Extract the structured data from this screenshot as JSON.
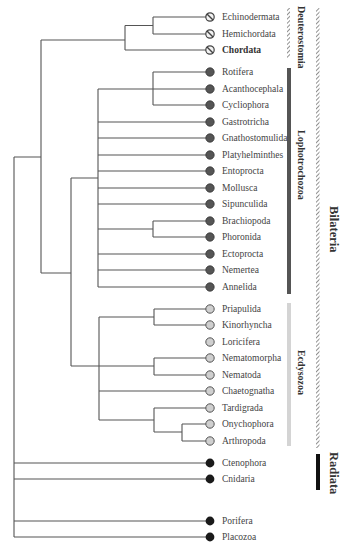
{
  "figure": {
    "styles": {
      "line_color": "#555555",
      "deuterostome_fill": "#f2f2f2",
      "lophotrochozoa_fill": "#555555",
      "ecdysozoa_fill": "#c8c8c8",
      "basal_fill": "#1a1a1a",
      "lophotrochozoa_bar": "#555555",
      "ecdysozoa_bar": "#d4d4d4",
      "radiata_bar": "#111111"
    }
  },
  "taxa": [
    {
      "name": "Echinodermata",
      "group": "deut",
      "y": 17
    },
    {
      "name": "Hemichordata",
      "group": "deut",
      "y": 34
    },
    {
      "name": "Chordata",
      "group": "deut",
      "y": 50,
      "bold": true
    },
    {
      "name": "Rotifera",
      "group": "lopho",
      "y": 72
    },
    {
      "name": "Acanthocephala",
      "group": "lopho",
      "y": 89
    },
    {
      "name": "Cycliophora",
      "group": "lopho",
      "y": 105
    },
    {
      "name": "Gastrotricha",
      "group": "lopho",
      "y": 122
    },
    {
      "name": "Gnathostomulida",
      "group": "lopho",
      "y": 138
    },
    {
      "name": "Platyhelminthes",
      "group": "lopho",
      "y": 155
    },
    {
      "name": "Entoprocta",
      "group": "lopho",
      "y": 171
    },
    {
      "name": "Mollusca",
      "group": "lopho",
      "y": 188
    },
    {
      "name": "Sipunculida",
      "group": "lopho",
      "y": 204
    },
    {
      "name": "Brachiopoda",
      "group": "lopho",
      "y": 221
    },
    {
      "name": "Phoronida",
      "group": "lopho",
      "y": 237
    },
    {
      "name": "Ectoprocta",
      "group": "lopho",
      "y": 254
    },
    {
      "name": "Nemertea",
      "group": "lopho",
      "y": 270
    },
    {
      "name": "Annelida",
      "group": "lopho",
      "y": 287
    },
    {
      "name": "Priapulida",
      "group": "ecdy",
      "y": 309
    },
    {
      "name": "Kinorhyncha",
      "group": "ecdy",
      "y": 325
    },
    {
      "name": "Loricifera",
      "group": "ecdy",
      "y": 342
    },
    {
      "name": "Nematomorpha",
      "group": "ecdy",
      "y": 358
    },
    {
      "name": "Nematoda",
      "group": "ecdy",
      "y": 375
    },
    {
      "name": "Chaetognatha",
      "group": "ecdy",
      "y": 391
    },
    {
      "name": "Tardigrada",
      "group": "ecdy",
      "y": 408
    },
    {
      "name": "Onychophora",
      "group": "ecdy",
      "y": 424
    },
    {
      "name": "Arthropoda",
      "group": "ecdy",
      "y": 441
    },
    {
      "name": "Ctenophora",
      "group": "basal",
      "y": 463
    },
    {
      "name": "Cnidaria",
      "group": "basal",
      "y": 479
    },
    {
      "name": "Porifera",
      "group": "basal",
      "y": 521
    },
    {
      "name": "Placozoa",
      "group": "basal",
      "y": 537
    }
  ],
  "clades": {
    "deuterostomia": "Deuterostomia",
    "lophotrochozoa": "Lophotrochozoa",
    "ecdysozoa": "Ecdysozoa",
    "bilateria": "Bilateria",
    "radiata": "Radiata"
  }
}
